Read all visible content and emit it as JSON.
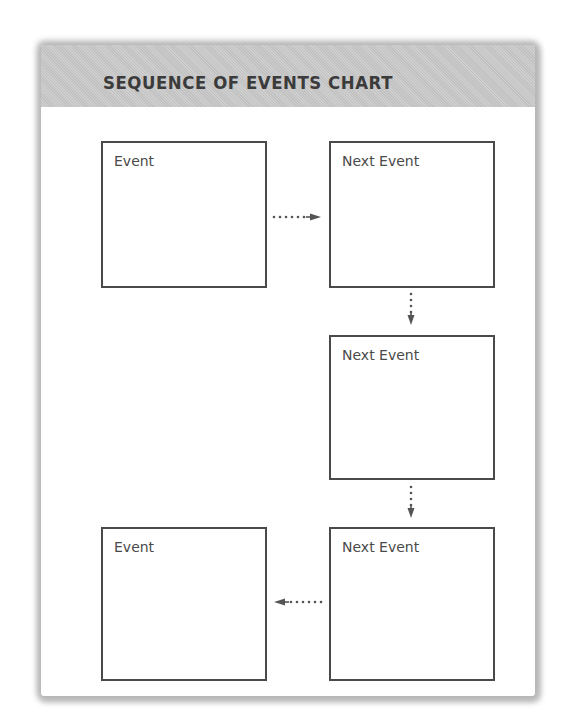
{
  "chart": {
    "title": "SEQUENCE OF EVENTS CHART",
    "colors": {
      "header_bg": "#c9c9c9",
      "title_text": "#3b3b3b",
      "box_border": "#4a4a4a",
      "label_text": "#4a4a4a",
      "arrow": "#555555"
    },
    "boxes": [
      {
        "id": "box-1",
        "label": "Event",
        "position": "top-left"
      },
      {
        "id": "box-2",
        "label": "Next Event",
        "position": "top-right"
      },
      {
        "id": "box-3",
        "label": "Next Event",
        "position": "middle-right"
      },
      {
        "id": "box-4",
        "label": "Next Event",
        "position": "bottom-right"
      },
      {
        "id": "box-5",
        "label": "Event",
        "position": "bottom-left"
      }
    ],
    "arrows": [
      {
        "from": "box-1",
        "to": "box-2",
        "direction": "right",
        "style": "dotted"
      },
      {
        "from": "box-2",
        "to": "box-3",
        "direction": "down",
        "style": "dotted"
      },
      {
        "from": "box-3",
        "to": "box-4",
        "direction": "down",
        "style": "dotted"
      },
      {
        "from": "box-4",
        "to": "box-5",
        "direction": "left",
        "style": "dotted"
      }
    ]
  }
}
